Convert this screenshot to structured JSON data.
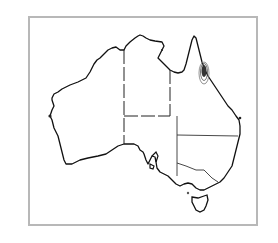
{
  "map": {
    "title": "Australia",
    "region_labels": [
      "Western Australia",
      "Northern Territory",
      "South Australia",
      "Queensland",
      "New South Wales",
      "Victoria",
      "Tasmania"
    ],
    "highlight": {
      "description": "Contoured distribution area on north-east Queensland coast",
      "color": "#333333"
    },
    "colors": {
      "coastline": "#111111",
      "borders": "#222222",
      "frame": "#b8b8b8",
      "background": "#ffffff"
    }
  }
}
